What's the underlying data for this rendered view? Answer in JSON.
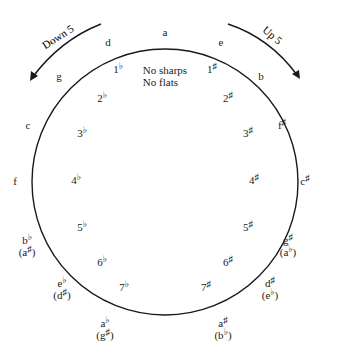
{
  "diagram": {
    "type": "circle-of-fifths",
    "center_label": [
      "No sharps",
      "No flats"
    ],
    "top_key": "a",
    "arrows": {
      "left": {
        "label": "Down 5",
        "direction": "counterclockwise"
      },
      "right": {
        "label": "Up 5",
        "direction": "clockwise"
      }
    },
    "sharp_side": [
      {
        "count": "1",
        "accidental": "♯",
        "key": "e"
      },
      {
        "count": "2",
        "accidental": "♯",
        "key": "b"
      },
      {
        "count": "3",
        "accidental": "♯",
        "key": "f♯"
      },
      {
        "count": "4",
        "accidental": "♯",
        "key": "c♯"
      },
      {
        "count": "5",
        "accidental": "♯",
        "key": "g♯",
        "enharmonic": "(a♭)"
      },
      {
        "count": "6",
        "accidental": "♯",
        "key": "d♯",
        "enharmonic": "(e♭)"
      },
      {
        "count": "7",
        "accidental": "♯",
        "key": "a♯",
        "enharmonic": "(b♭)"
      }
    ],
    "flat_side": [
      {
        "count": "1",
        "accidental": "♭",
        "key": "d"
      },
      {
        "count": "2",
        "accidental": "♭",
        "key": "g"
      },
      {
        "count": "3",
        "accidental": "♭",
        "key": "c"
      },
      {
        "count": "4",
        "accidental": "♭",
        "key": "f"
      },
      {
        "count": "5",
        "accidental": "♭",
        "key": "b♭",
        "enharmonic": "(a♯)"
      },
      {
        "count": "6",
        "accidental": "♭",
        "key": "e♭",
        "enharmonic": "(d♯)"
      },
      {
        "count": "7",
        "accidental": "♭",
        "key": "a♭",
        "enharmonic": "(g♯)"
      }
    ]
  }
}
